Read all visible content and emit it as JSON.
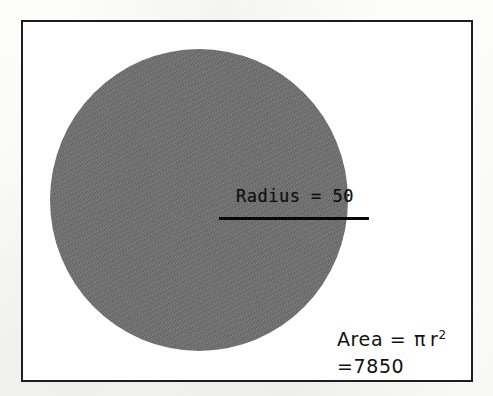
{
  "figure": {
    "kind": "geometry-diagram",
    "frame": {
      "border_color": "#1e1e1e",
      "fill_color": "#ffffff"
    },
    "background_color": "#fbfbfa"
  },
  "circle": {
    "name": "shaded-circle",
    "fill_color": "#6c6c6c",
    "radius_value": "50"
  },
  "radius_annotation": {
    "label": "Radius = 50",
    "line_color": "#080808"
  },
  "area_annotation": {
    "formula_prefix": "Area = ",
    "pi_symbol": "π",
    "variable": "r",
    "exponent": "2",
    "result": "=7850"
  },
  "chart_data": {
    "type": "diagram",
    "shapes": [
      {
        "shape": "circle",
        "label": "shaded circle",
        "fill": "#6c6c6c",
        "radius": 50,
        "radius_label": "Radius = 50",
        "area_formula": "Area = π r²",
        "area_value": 7850
      }
    ],
    "annotations": [
      "Radius = 50",
      "Area = π r²",
      "=7850"
    ],
    "legend": "none",
    "grid": false
  }
}
